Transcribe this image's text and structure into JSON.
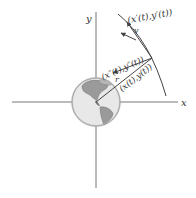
{
  "diagram": {
    "axes": {
      "x_label": "x",
      "y_label": "y"
    },
    "labels": {
      "velocity_vector": "(x′(t),y′(t))",
      "velocity_symbol": "v",
      "acceleration_vector": "(x″(t),y″(t))",
      "position_vector": "(x(t),y(t))",
      "radius_symbol": "r"
    },
    "objects": {
      "center_body": "Earth globe",
      "path": "circular orbit arc"
    },
    "colors": {
      "lines": "#555555",
      "globe_ocean": "#e6e6e6",
      "globe_land": "#8a8a8a",
      "text": "#333333"
    }
  }
}
